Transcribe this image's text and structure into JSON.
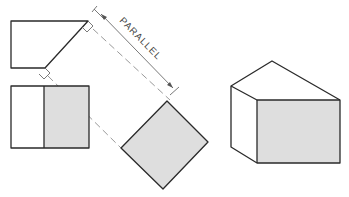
{
  "diagram": {
    "type": "orthographic-auxiliary-view",
    "annotation": {
      "label": "PARALLEL"
    },
    "views": [
      {
        "name": "top-view",
        "description": "pentagon with chamfered corner"
      },
      {
        "name": "front-view",
        "description": "rectangle split into unshaded and shaded faces"
      },
      {
        "name": "auxiliary-view",
        "description": "rotated square (true size of inclined face), shaded"
      },
      {
        "name": "isometric-view",
        "description": "pictorial block with sloped top and shaded front face"
      }
    ],
    "colors": {
      "outline": "#2a2a2a",
      "shade": "#dedede",
      "projection_line": "#9a9a9a"
    }
  }
}
